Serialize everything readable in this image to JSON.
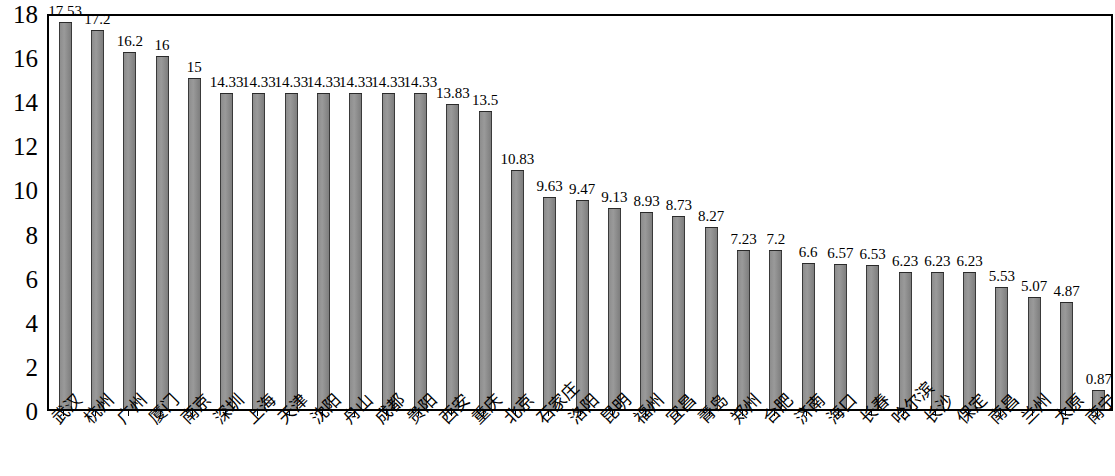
{
  "chart_data": {
    "type": "bar",
    "title": "",
    "subtitle": "",
    "xlabel": "",
    "ylabel": "",
    "ylim": [
      0,
      18
    ],
    "ytick_step": 2,
    "yticks": [
      0,
      2,
      4,
      6,
      8,
      10,
      12,
      14,
      16,
      18
    ],
    "grid": false,
    "legend": null,
    "legend_position": "none",
    "value_labels_shown": true,
    "bar_color": "#8f8f8f",
    "bar_border_color": "#2a2a2a",
    "axis_color": "#000000",
    "background_color": "#ffffff",
    "categories": [
      "武汉",
      "杭州",
      "广州",
      "厦门",
      "南京",
      "深圳",
      "上海",
      "天津",
      "沈阳",
      "舟山",
      "成都",
      "贵阳",
      "西安",
      "重庆",
      "北京",
      "石家庄",
      "洛阳",
      "昆明",
      "福州",
      "宜昌",
      "青岛",
      "郑州",
      "合肥",
      "济南",
      "海口",
      "长春",
      "哈尔滨",
      "长沙",
      "保定",
      "南昌",
      "兰州",
      "太原",
      "南宁"
    ],
    "values": [
      17.53,
      17.2,
      16.2,
      16,
      15,
      14.33,
      14.33,
      14.33,
      14.33,
      14.33,
      14.33,
      14.33,
      13.83,
      13.5,
      10.83,
      9.63,
      9.47,
      9.13,
      8.93,
      8.73,
      8.27,
      7.23,
      7.2,
      6.6,
      6.57,
      6.53,
      6.23,
      6.23,
      6.23,
      5.53,
      5.07,
      4.87,
      0.87
    ],
    "value_label_texts": [
      "17.53",
      "17.2",
      "16.2",
      "16",
      "15",
      "14.33",
      "14.33",
      "14.33",
      "14.33",
      "14.33",
      "14.33",
      "14.33",
      "13.83",
      "13.5",
      "10.83",
      "9.63",
      "9.47",
      "9.13",
      "8.93",
      "8.73",
      "8.27",
      "7.23",
      "7.2",
      "6.6",
      "6.57",
      "6.53",
      "6.23",
      "6.23",
      "6.23",
      "5.53",
      "5.07",
      "4.87",
      "0.87"
    ],
    "ytick_labels": [
      "18",
      "16",
      "14",
      "12",
      "10",
      "8",
      "6",
      "4",
      "2",
      "0"
    ]
  }
}
